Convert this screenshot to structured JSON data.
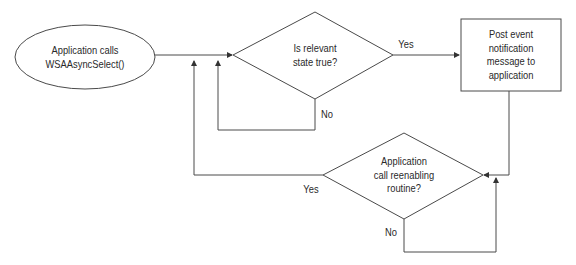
{
  "diagram": {
    "type": "flowchart",
    "nodes": {
      "start": {
        "shape": "ellipse",
        "line1": "Application calls",
        "line2": "WSAAsyncSelect()"
      },
      "decision1": {
        "shape": "diamond",
        "line1": "Is relevant",
        "line2": "state true?"
      },
      "post": {
        "shape": "rectangle",
        "line1": "Post event",
        "line2": "notification",
        "line3": "message to",
        "line4": "application"
      },
      "decision2": {
        "shape": "diamond",
        "line1": "Application",
        "line2": "call reenabling",
        "line3": "routine?"
      }
    },
    "edge_labels": {
      "d1_yes": "Yes",
      "d1_no": "No",
      "d2_yes": "Yes",
      "d2_no": "No"
    },
    "colors": {
      "stroke": "#4a4a4a",
      "text": "#2a2a2a",
      "background": "#ffffff"
    }
  }
}
